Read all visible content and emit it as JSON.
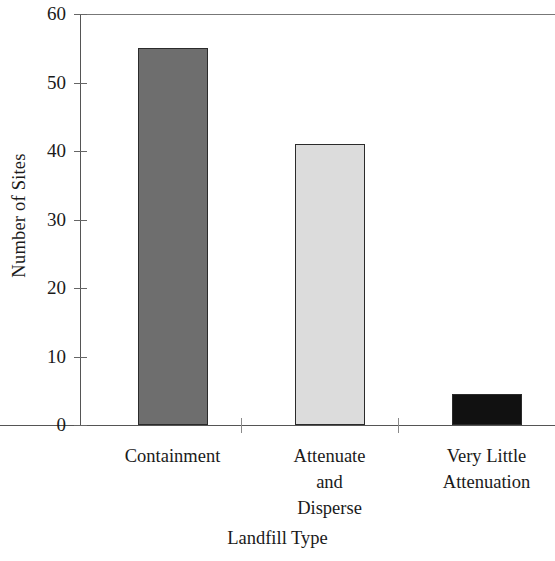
{
  "chart_data": {
    "type": "bar",
    "title": "",
    "subtitle": "",
    "xlabel": "Landfill Type",
    "ylabel": "Number of Sites",
    "categories": [
      "Containment",
      "Attenuate and Disperse",
      "Very Little Attenuation"
    ],
    "category_label_lines": [
      [
        "Containment"
      ],
      [
        "Attenuate",
        "and",
        "Disperse"
      ],
      [
        "Very Little",
        "Attenuation"
      ]
    ],
    "values": [
      55,
      41,
      4.5
    ],
    "ylim": [
      0,
      60
    ],
    "yticks": [
      0,
      10,
      20,
      30,
      40,
      50,
      60
    ],
    "ytick_labels": [
      "0",
      "10",
      "20",
      "30",
      "40",
      "50",
      "60"
    ],
    "grid": false,
    "legend": null,
    "legend_position": "none",
    "bar_colors": [
      "#6e6e6e",
      "#dcdcdc",
      "#111111"
    ],
    "bar_border_color": "#2b2b2b",
    "axis_color": "#555555",
    "text_color": "#1a1a1a",
    "background": "#ffffff"
  },
  "axis": {
    "y_title": "Number of Sites",
    "x_title": "Landfill Type"
  }
}
